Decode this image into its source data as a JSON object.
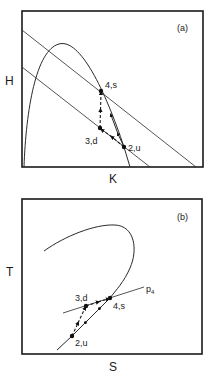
{
  "figure": {
    "panels": [
      {
        "id": "a",
        "panel_label": "(a)",
        "x_axis_label": "K",
        "y_axis_label": "H",
        "points": [
          {
            "id": "4",
            "label": "4,s"
          },
          {
            "id": "3",
            "label": "3,d"
          },
          {
            "id": "2",
            "label": "2,u"
          }
        ],
        "path_sequence": [
          "2,u",
          "3,d",
          "4,s"
        ],
        "curves": [
          "parabolic-arc",
          "upper-straight-line",
          "lower-straight-line"
        ]
      },
      {
        "id": "b",
        "panel_label": "(b)",
        "x_axis_label": "S",
        "y_axis_label": "T",
        "line_label": "p",
        "line_label_subscript": "4",
        "points": [
          {
            "id": "3",
            "label": "3,d"
          },
          {
            "id": "4",
            "label": "4,s"
          },
          {
            "id": "2",
            "label": "2,u"
          }
        ],
        "path_sequence": [
          "2,u",
          "3,d",
          "4,s"
        ],
        "curves": [
          "hooked-curve",
          "isobar-p4"
        ]
      }
    ],
    "colors": {
      "ink": "#1a1a1a",
      "background": "#ffffff"
    }
  }
}
